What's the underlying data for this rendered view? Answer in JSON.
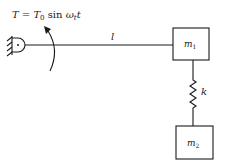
{
  "diagram": {
    "torque_equation": {
      "lhs": "T",
      "equals": " = ",
      "base": "T",
      "base_sub": "0",
      "func": " sin ",
      "omega": "ω",
      "omega_sub": "t",
      "var": "t"
    },
    "rod_label": "l",
    "mass1_label": "m",
    "mass1_sub": "1",
    "spring_label": "k",
    "mass2_label": "m",
    "mass2_sub": "2",
    "colors": {
      "ink": "#1a1a1a",
      "background": "#ffffff"
    }
  }
}
